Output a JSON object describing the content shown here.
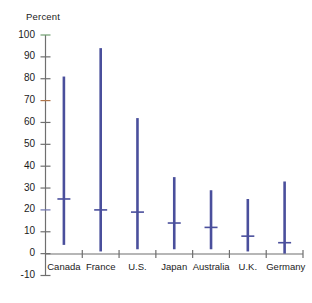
{
  "chart_data": {
    "type": "bar",
    "title": "",
    "subtitle": "",
    "xlabel": "",
    "ylabel": "Percent",
    "ylim": [
      -10,
      100
    ],
    "ytick_values": [
      -10,
      0,
      10,
      20,
      30,
      40,
      50,
      60,
      70,
      80,
      90,
      100
    ],
    "ytick_labels": [
      "-10",
      "0",
      "10",
      "20",
      "30",
      "40",
      "50",
      "60",
      "70",
      "80",
      "90",
      "100"
    ],
    "grid": false,
    "legend": "none",
    "categories": [
      "Canada",
      "France",
      "U.S.",
      "Japan",
      "Australia",
      "U.K.",
      "Germany"
    ],
    "series": [
      {
        "name": "High",
        "values": [
          81,
          94,
          62,
          35,
          29,
          25,
          33
        ]
      },
      {
        "name": "Low",
        "values": [
          4,
          1,
          2,
          2,
          2,
          1,
          0
        ]
      },
      {
        "name": "Median",
        "values": [
          25,
          20,
          19,
          14,
          12,
          8,
          5
        ]
      }
    ],
    "colors": {
      "bar": "#4a4f9c",
      "axis": "#6f6f6f",
      "text": "#1b1b1b",
      "background": "#ffffff"
    }
  }
}
